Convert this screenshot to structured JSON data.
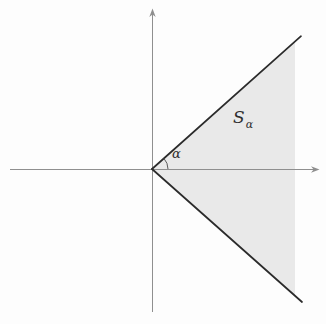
{
  "figure": {
    "region_label": {
      "base": "S",
      "subscript": "α"
    },
    "angle_label": "α"
  },
  "colors": {
    "background": "#fdfdfd",
    "shading": "#e9e9e9",
    "ray": "#2b2b2b",
    "axis": "#8f8f8f",
    "arc": "#4a4a4a",
    "label": "#2f2f2f"
  }
}
